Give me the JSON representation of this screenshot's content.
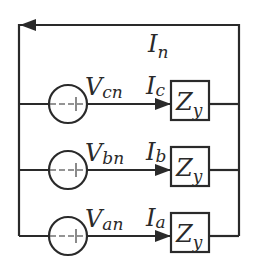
{
  "diagram": {
    "neutral": {
      "label_main": "I",
      "label_sub": "n",
      "direction": "left"
    },
    "phases": [
      {
        "id": "c",
        "source_main": "V",
        "source_sub": "cn",
        "current_main": "I",
        "current_sub": "c",
        "load_main": "Z",
        "load_sub": "y"
      },
      {
        "id": "b",
        "source_main": "V",
        "source_sub": "bn",
        "current_main": "I",
        "current_sub": "b",
        "load_main": "Z",
        "load_sub": "y"
      },
      {
        "id": "a",
        "source_main": "V",
        "source_sub": "an",
        "current_main": "I",
        "current_sub": "a",
        "load_main": "Z",
        "load_sub": "y"
      }
    ],
    "colors": {
      "line": "#2a2a2a",
      "background": "#ffffff"
    }
  }
}
